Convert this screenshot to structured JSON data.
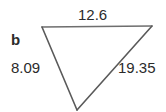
{
  "figure": {
    "type": "triangle-diagram",
    "shape_label": "b",
    "background_color": "#ffffff",
    "stroke_color": "#6e6e6e",
    "text_color": "#2b2b2b",
    "vertices": {
      "top_left": {
        "x": 42,
        "y": 27
      },
      "top_right": {
        "x": 152,
        "y": 26
      },
      "bottom": {
        "x": 77,
        "y": 110
      }
    },
    "sides": [
      {
        "name": "top",
        "label": "12.6",
        "value": 12.6
      },
      {
        "name": "left",
        "label": "8.09",
        "value": 8.09
      },
      {
        "name": "right",
        "label": "19.35",
        "value": 19.35
      }
    ]
  }
}
